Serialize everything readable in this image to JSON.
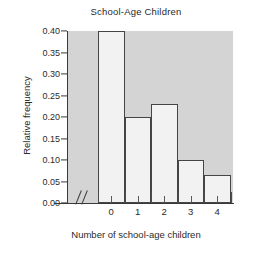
{
  "chart_data": {
    "type": "bar",
    "title": "School-Age Children",
    "xlabel": "Number of school-age children",
    "ylabel": "Relative frequency",
    "categories": [
      "0",
      "1",
      "2",
      "3",
      "4"
    ],
    "values": [
      0.4,
      0.2,
      0.23,
      0.1,
      0.065
    ],
    "ylim": [
      0.0,
      0.4
    ],
    "ytick_labels": [
      "0.00",
      "0.05",
      "0.10",
      "0.15",
      "0.20",
      "0.25",
      "0.30",
      "0.35",
      "0.40"
    ],
    "ytick_values": [
      0.0,
      0.05,
      0.1,
      0.15,
      0.2,
      0.25,
      0.3,
      0.35,
      0.4
    ],
    "grid": false,
    "legend": "none",
    "axis_break": "//",
    "colors": {
      "plot_background": "#d4d4d4",
      "bar_fill": "#f2f2f2",
      "bar_edge": "#454545",
      "axis": "#3a3a3a",
      "text": "#2a2a2a",
      "figure_background": "#ffffff"
    }
  }
}
